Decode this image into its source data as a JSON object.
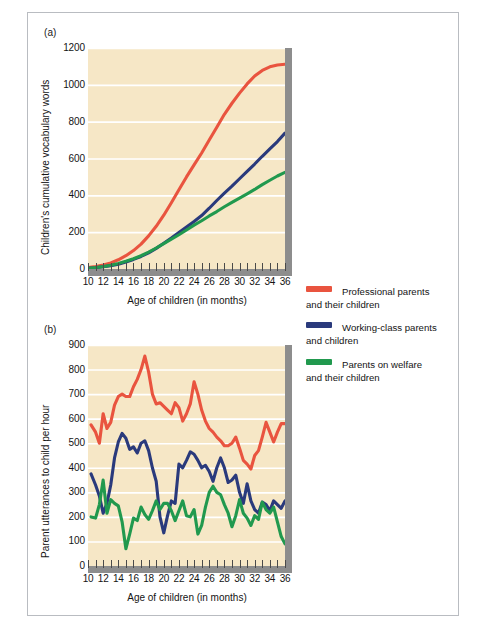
{
  "figure": {
    "panel_a_label": "(a)",
    "panel_b_label": "(b)"
  },
  "legend": {
    "items": [
      {
        "name": "professional",
        "color": "#e9543f",
        "line1": "Professional parents",
        "line2": "and their children"
      },
      {
        "name": "working-class",
        "color": "#2a3a7c",
        "line1": "Working-class parents",
        "line2": "and children"
      },
      {
        "name": "welfare",
        "color": "#21994e",
        "line1": "Parents on welfare",
        "line2": "and their children"
      }
    ]
  },
  "chart_data": [
    {
      "id": "panel-a",
      "type": "line",
      "title": "(a)",
      "xlabel": "Age of children (in months)",
      "ylabel": "Children's cumulative vocabulary words",
      "xlim": [
        10,
        36
      ],
      "ylim": [
        0,
        1200
      ],
      "xticks": [
        10,
        11,
        12,
        13,
        14,
        15,
        16,
        17,
        18,
        19,
        20,
        21,
        22,
        23,
        24,
        25,
        26,
        27,
        28,
        29,
        30,
        31,
        32,
        33,
        34,
        35,
        36
      ],
      "xticklabels": [
        "10",
        "12",
        "14",
        "16",
        "18",
        "20",
        "22",
        "24",
        "26",
        "28",
        "30",
        "32",
        "34",
        "36"
      ],
      "yticks": [
        0,
        200,
        400,
        600,
        800,
        1000,
        1200
      ],
      "yticklabels": [
        "0",
        "200",
        "400",
        "600",
        "800",
        "1000",
        "1200"
      ],
      "grid": "horizontal",
      "plot_background": "#f6e7c6",
      "gridline_color": "#ffffff",
      "x": [
        10,
        11,
        12,
        13,
        14,
        15,
        16,
        17,
        18,
        19,
        20,
        21,
        22,
        23,
        24,
        25,
        26,
        27,
        28,
        29,
        30,
        31,
        32,
        33,
        34,
        35,
        36
      ],
      "series": [
        {
          "name": "Professional parents and their children",
          "color": "#e9543f",
          "values": [
            8,
            14,
            22,
            33,
            50,
            72,
            100,
            135,
            180,
            232,
            292,
            360,
            430,
            500,
            565,
            630,
            700,
            770,
            840,
            900,
            955,
            1005,
            1048,
            1078,
            1098,
            1108,
            1112
          ]
        },
        {
          "name": "Working-class parents and children",
          "color": "#2a3a7c",
          "values": [
            4,
            7,
            12,
            18,
            26,
            38,
            52,
            68,
            88,
            112,
            140,
            168,
            198,
            228,
            258,
            290,
            330,
            372,
            412,
            450,
            490,
            530,
            570,
            612,
            652,
            692,
            738
          ]
        },
        {
          "name": "Parents on welfare and their children",
          "color": "#21994e",
          "values": [
            4,
            8,
            13,
            20,
            30,
            42,
            56,
            72,
            92,
            114,
            138,
            162,
            186,
            212,
            238,
            262,
            288,
            312,
            338,
            362,
            385,
            408,
            432,
            458,
            482,
            505,
            525
          ]
        }
      ]
    },
    {
      "id": "panel-b",
      "type": "line",
      "title": "(b)",
      "xlabel": "Age of children (in months)",
      "ylabel": "Parent utterances to child per hour",
      "xlim": [
        10,
        36
      ],
      "ylim": [
        0,
        900
      ],
      "xticks": [
        10,
        11,
        12,
        13,
        14,
        15,
        16,
        17,
        18,
        19,
        20,
        21,
        22,
        23,
        24,
        25,
        26,
        27,
        28,
        29,
        30,
        31,
        32,
        33,
        34,
        35,
        36
      ],
      "xticklabels": [
        "10",
        "12",
        "14",
        "16",
        "18",
        "20",
        "22",
        "24",
        "26",
        "28",
        "30",
        "32",
        "34",
        "36"
      ],
      "yticks": [
        0,
        100,
        200,
        300,
        400,
        500,
        600,
        700,
        800,
        900
      ],
      "yticklabels": [
        "0",
        "100",
        "200",
        "300",
        "400",
        "500",
        "600",
        "700",
        "800",
        "900"
      ],
      "grid": "horizontal",
      "plot_background": "#f6e7c6",
      "gridline_color": "#ffffff",
      "x": [
        10.4,
        11,
        11.5,
        12,
        12.5,
        13,
        13.5,
        14,
        14.5,
        15,
        15.5,
        16,
        16.5,
        17,
        17.5,
        18,
        18.5,
        19,
        19.5,
        20,
        20.5,
        21,
        21.5,
        22,
        22.5,
        23,
        23.5,
        24,
        24.5,
        25,
        25.5,
        26,
        26.5,
        27,
        27.5,
        28,
        28.5,
        29,
        29.5,
        30,
        30.5,
        31,
        31.5,
        32,
        32.5,
        33,
        33.5,
        34,
        34.5,
        35,
        35.5,
        36
      ],
      "series": [
        {
          "name": "Professional parents and their children",
          "color": "#e9543f",
          "values": [
            575,
            545,
            500,
            620,
            560,
            585,
            655,
            690,
            700,
            690,
            690,
            730,
            760,
            800,
            855,
            790,
            700,
            660,
            665,
            650,
            635,
            620,
            665,
            645,
            590,
            620,
            660,
            750,
            700,
            635,
            590,
            560,
            545,
            525,
            510,
            490,
            490,
            500,
            525,
            480,
            430,
            415,
            395,
            450,
            470,
            525,
            585,
            545,
            505,
            545,
            580,
            580
          ]
        },
        {
          "name": "Working-class parents and children",
          "color": "#2a3a7c",
          "values": [
            375,
            330,
            285,
            215,
            255,
            330,
            440,
            505,
            540,
            520,
            475,
            485,
            460,
            500,
            510,
            470,
            400,
            345,
            200,
            135,
            205,
            265,
            255,
            415,
            400,
            430,
            465,
            455,
            430,
            400,
            410,
            385,
            345,
            400,
            440,
            400,
            340,
            350,
            370,
            300,
            255,
            335,
            265,
            230,
            215,
            260,
            250,
            225,
            265,
            250,
            235,
            265
          ]
        },
        {
          "name": "Parents on welfare and their children",
          "color": "#21994e",
          "values": [
            200,
            195,
            250,
            350,
            215,
            270,
            255,
            245,
            180,
            70,
            130,
            195,
            185,
            240,
            210,
            190,
            225,
            265,
            230,
            255,
            255,
            225,
            185,
            225,
            265,
            205,
            200,
            230,
            130,
            165,
            240,
            300,
            325,
            300,
            290,
            250,
            215,
            160,
            205,
            270,
            215,
            195,
            165,
            205,
            190,
            260,
            230,
            215,
            240,
            180,
            120,
            90
          ]
        }
      ]
    }
  ]
}
